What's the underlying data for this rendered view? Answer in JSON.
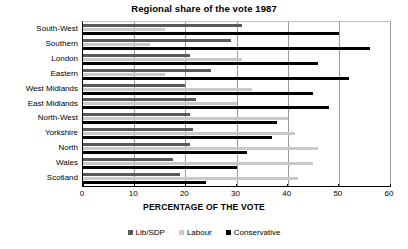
{
  "chart_data": {
    "type": "bar",
    "orientation": "horizontal",
    "title": "Regional share of the vote 1987",
    "xlabel": "PERCENTAGE OF THE VOTE",
    "ylabel": "",
    "xlim": [
      0,
      60
    ],
    "xticks": [
      0,
      10,
      20,
      30,
      40,
      50,
      60
    ],
    "grid": true,
    "legend_position": "bottom",
    "categories": [
      "South-West",
      "Southern",
      "London",
      "Eastern",
      "West Midlands",
      "East Midlands",
      "North-West",
      "Yorkshire",
      "North",
      "Wales",
      "Scotland"
    ],
    "series": [
      {
        "name": "Lib/SDP",
        "color": "#595959",
        "values": [
          31,
          29,
          21,
          25,
          20,
          22,
          21,
          21.5,
          21,
          17.5,
          19
        ]
      },
      {
        "name": "Labour",
        "color": "#c9c9c9",
        "values": [
          16,
          13,
          31,
          16,
          33,
          30,
          40,
          41.5,
          46,
          45,
          42
        ]
      },
      {
        "name": "Conservative",
        "color": "#000000",
        "values": [
          50,
          56,
          46,
          52,
          45,
          48,
          38,
          37,
          32,
          30,
          24
        ]
      }
    ]
  },
  "legend": {
    "items": [
      {
        "label": "Lib/SDP"
      },
      {
        "label": "Labour"
      },
      {
        "label": "Conservative"
      }
    ]
  }
}
